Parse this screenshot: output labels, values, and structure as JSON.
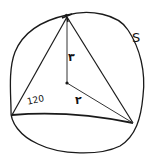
{
  "diagram": {
    "type": "inscribed-triangle-in-circle",
    "style": "hand-drawn",
    "stroke_color": "#1a1a1a",
    "background": "#ffffff",
    "labels": {
      "angle": "120",
      "radius_vertical": "۳",
      "radius_lower": "۲",
      "area_or_curve": "S"
    },
    "points": {
      "top_vertex": [
        67,
        17
      ],
      "bottom_left_vertex": [
        12,
        115
      ],
      "bottom_right_vertex": [
        133,
        123
      ],
      "center": [
        67,
        83
      ]
    }
  }
}
